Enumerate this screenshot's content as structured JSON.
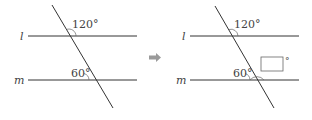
{
  "left_figure": {
    "line_top_label": "l",
    "line_bottom_label": "m",
    "angle_top": "120°",
    "angle_bottom": "60°"
  },
  "arrow": "right-arrow",
  "right_figure": {
    "line_top_label": "l",
    "line_bottom_label": "m",
    "angle_top": "120°",
    "angle_bottom": "60°",
    "blank_box_suffix": "°"
  },
  "colors": {
    "line": "#333333",
    "arrow": "#9a9a9a",
    "text": "#444444"
  }
}
